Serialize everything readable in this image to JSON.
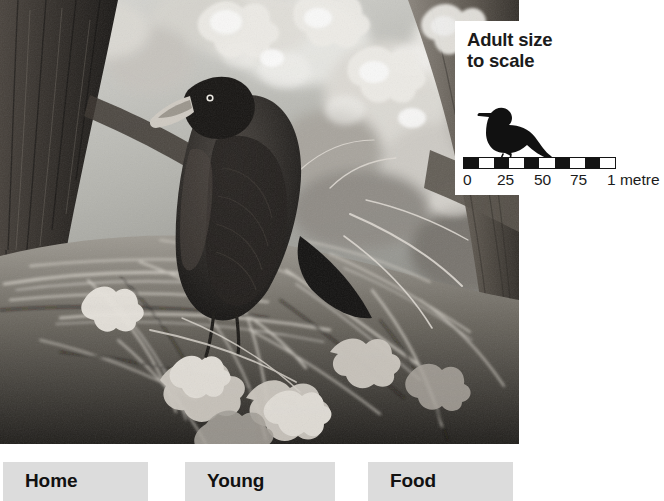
{
  "photo": {
    "alt": "Black rook perched on a large twig nest in the fork of an oak tree",
    "subject": "rook-at-nest",
    "treatment": "black-and-white-photograph"
  },
  "size_inset": {
    "title": "Adult size\nto scale",
    "silhouette_name": "rook-silhouette",
    "scale_bar": {
      "segments": [
        "dark",
        "light",
        "dark",
        "light",
        "dark",
        "light",
        "dark",
        "light",
        "dark",
        "light"
      ],
      "segment_count": 10,
      "tick_labels": [
        "0",
        "25",
        "50",
        "75",
        "1 metre"
      ],
      "tick_positions": [
        8,
        42,
        79,
        115,
        156
      ],
      "unit": "centimetres",
      "total_label": "1 metre",
      "bar_color": "#141414"
    }
  },
  "nav": {
    "buttons": [
      {
        "label": "Home",
        "name": "home"
      },
      {
        "label": "Young",
        "name": "young"
      },
      {
        "label": "Food",
        "name": "food"
      }
    ],
    "button_color": "#dcdcdc"
  }
}
